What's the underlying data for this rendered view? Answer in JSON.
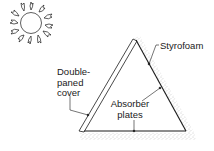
{
  "diagram": {
    "labels": {
      "styrofoam": "Styrofoam",
      "cover_line1": "Double-",
      "cover_line2": "paned",
      "cover_line3": "cover",
      "absorber_line1": "Absorber",
      "absorber_line2": "plates"
    },
    "elements": [
      {
        "name": "sun",
        "icon": "sun-icon"
      },
      {
        "name": "double-paned-cover"
      },
      {
        "name": "absorber-plates"
      },
      {
        "name": "styrofoam-insulation"
      }
    ],
    "colors": {
      "line": "#1a1a1a",
      "stipple": "#9a9a9a",
      "background": "#ffffff"
    }
  }
}
